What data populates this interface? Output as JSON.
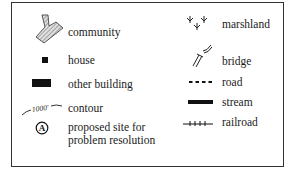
{
  "legend": {
    "left_column": [
      {
        "symbol": "community-icon",
        "label": "community"
      },
      {
        "symbol": "house-icon",
        "label": "house"
      },
      {
        "symbol": "other-building-icon",
        "label": "other building"
      },
      {
        "symbol": "contour-icon",
        "label": "contour",
        "symbol_text": "1000'"
      },
      {
        "symbol": "proposed-site-icon",
        "label_line1": "proposed site for",
        "label_line2": "problem resolution",
        "symbol_text": "A"
      }
    ],
    "right_column": [
      {
        "symbol": "marshland-icon",
        "label": "marshland"
      },
      {
        "symbol": "bridge-icon",
        "label": "bridge"
      },
      {
        "symbol": "road-icon",
        "label": "road"
      },
      {
        "symbol": "stream-icon",
        "label": "stream"
      },
      {
        "symbol": "railroad-icon",
        "label": "railroad"
      }
    ]
  },
  "colors": {
    "border": "#333333",
    "symbol": "#111111",
    "community_fill": "#c8c8c8"
  }
}
